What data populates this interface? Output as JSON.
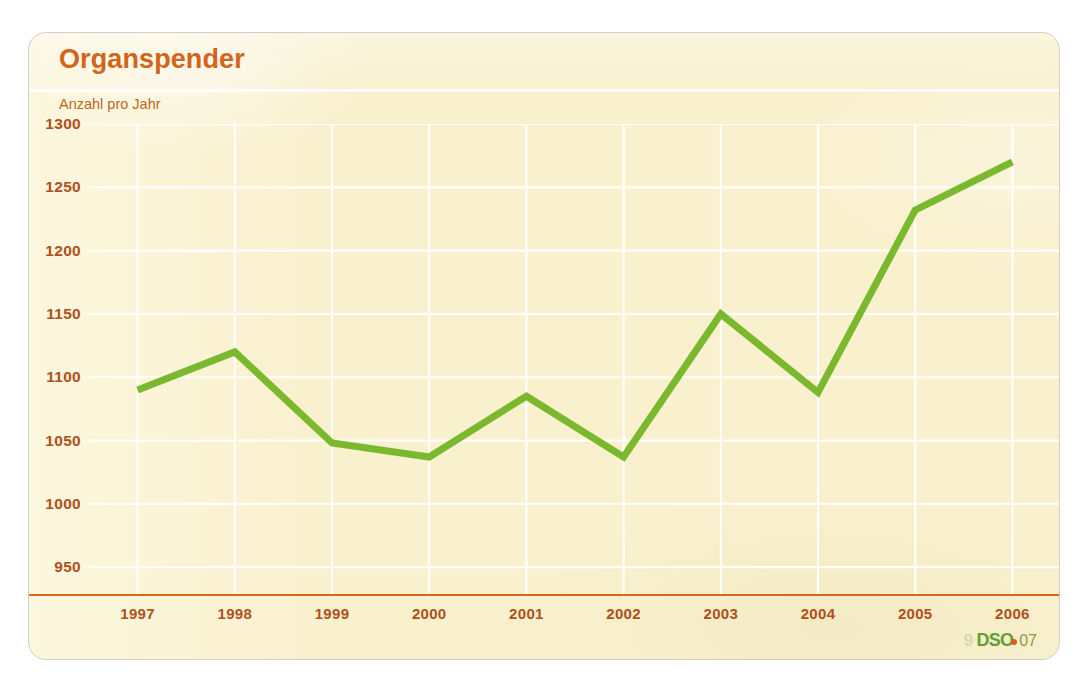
{
  "card": {
    "title": "Organspender",
    "axis_unit_label": "Anzahl pro Jahr"
  },
  "logo": {
    "ghost_text": "9",
    "mark_text": "DSO",
    "year_text": "07"
  },
  "colors": {
    "card_background": "#f9f0cd",
    "card_border": "#cfcfcf",
    "title": "#d4641a",
    "axis_text": "#b0501c",
    "axis_line": "#d4681d",
    "gridline": "#ffffff",
    "series_line": "#7ab82e",
    "logo_green": "#5a9b2f",
    "logo_dot": "#e2521c"
  },
  "chart_data": {
    "type": "line",
    "title": "Organspender",
    "subtitle": "",
    "xlabel": "",
    "ylabel": "Anzahl pro Jahr",
    "categories": [
      "1997",
      "1998",
      "1999",
      "2000",
      "2001",
      "2002",
      "2003",
      "2004",
      "2005",
      "2006"
    ],
    "values": [
      1090,
      1120,
      1048,
      1037,
      1085,
      1037,
      1150,
      1088,
      1232,
      1270
    ],
    "series": [
      {
        "name": "Organspender",
        "color": "#7ab82e",
        "values": [
          1090,
          1120,
          1048,
          1037,
          1085,
          1037,
          1150,
          1088,
          1232,
          1270
        ]
      }
    ],
    "ylim": [
      928,
      1300
    ],
    "yticks": [
      1300,
      1250,
      1200,
      1150,
      1100,
      1050,
      1000,
      950
    ],
    "ytick_labels": [
      "1300",
      "1250",
      "1200",
      "1150",
      "1100",
      "1050",
      "1000",
      "950"
    ],
    "xtick_labels": [
      "1997",
      "1998",
      "1999",
      "2000",
      "2001",
      "2002",
      "2003",
      "2004",
      "2005",
      "2006"
    ],
    "grid": true,
    "grid_color": "#ffffff",
    "legend": false,
    "legend_position": "none",
    "line_width": 7,
    "markers": false
  }
}
